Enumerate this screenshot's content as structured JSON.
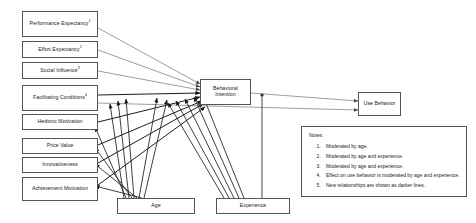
{
  "diagram": {
    "nodes": [
      {
        "id": "performance-expectancy",
        "label": "Performance Expectancy",
        "superscript": "1"
      },
      {
        "id": "effort-expectancy",
        "label": "Effort Expectancy",
        "superscript": "2"
      },
      {
        "id": "social-influence",
        "label": "Social Influence",
        "superscript": "3"
      },
      {
        "id": "facilitating-conditions",
        "label": "Facilitating Conditions",
        "superscript": "4"
      },
      {
        "id": "hedonic-motivation",
        "label": "Hedonic Motivation",
        "superscript": ""
      },
      {
        "id": "price-value",
        "label": "Price Value",
        "superscript": ""
      },
      {
        "id": "innovativeness",
        "label": "Innovativeness",
        "superscript": ""
      },
      {
        "id": "achievement-motivation",
        "label": "Achievement Motivation",
        "superscript": ""
      },
      {
        "id": "behavioral-intention",
        "label": "Behavioral Intention",
        "superscript": ""
      },
      {
        "id": "use-behavior",
        "label": "Use Behavior",
        "superscript": ""
      },
      {
        "id": "age",
        "label": "Age",
        "superscript": ""
      },
      {
        "id": "experience",
        "label": "Experience",
        "superscript": ""
      }
    ],
    "edges": [
      {
        "from": "performance-expectancy",
        "to": "behavioral-intention"
      },
      {
        "from": "effort-expectancy",
        "to": "behavioral-intention"
      },
      {
        "from": "social-influence",
        "to": "behavioral-intention"
      },
      {
        "from": "facilitating-conditions",
        "to": "behavioral-intention"
      },
      {
        "from": "facilitating-conditions",
        "to": "use-behavior"
      },
      {
        "from": "hedonic-motivation",
        "to": "behavioral-intention"
      },
      {
        "from": "price-value",
        "to": "behavioral-intention"
      },
      {
        "from": "innovativeness",
        "to": "behavioral-intention"
      },
      {
        "from": "achievement-motivation",
        "to": "behavioral-intention"
      },
      {
        "from": "behavioral-intention",
        "to": "use-behavior"
      },
      {
        "from": "age",
        "to": "performance-expectancy"
      },
      {
        "from": "age",
        "to": "effort-expectancy"
      },
      {
        "from": "age",
        "to": "social-influence"
      },
      {
        "from": "age",
        "to": "facilitating-conditions"
      },
      {
        "from": "age",
        "to": "hedonic-motivation"
      },
      {
        "from": "age",
        "to": "price-value"
      },
      {
        "from": "age",
        "to": "innovativeness"
      },
      {
        "from": "age",
        "to": "achievement-motivation"
      },
      {
        "from": "experience",
        "to": "effort-expectancy"
      },
      {
        "from": "experience",
        "to": "social-influence"
      },
      {
        "from": "experience",
        "to": "facilitating-conditions"
      },
      {
        "from": "experience",
        "to": "hedonic-motivation"
      },
      {
        "from": "experience",
        "to": "behavioral-intention"
      },
      {
        "from": "experience",
        "to": "use-behavior"
      }
    ],
    "colors": {
      "box_border": "#555555",
      "line": "#5a5a5a",
      "line_dark": "#1d1d1d",
      "text": "#1a1a1a",
      "background": "#ffffff"
    }
  },
  "notes": {
    "title": "Notes:",
    "items": [
      "Moderated by age.",
      "Moderated by age and experience.",
      "Moderated by age and experience.",
      "Effect on use behavior is moderated by age and experience.",
      "New relationships are shown as darker lines."
    ]
  }
}
